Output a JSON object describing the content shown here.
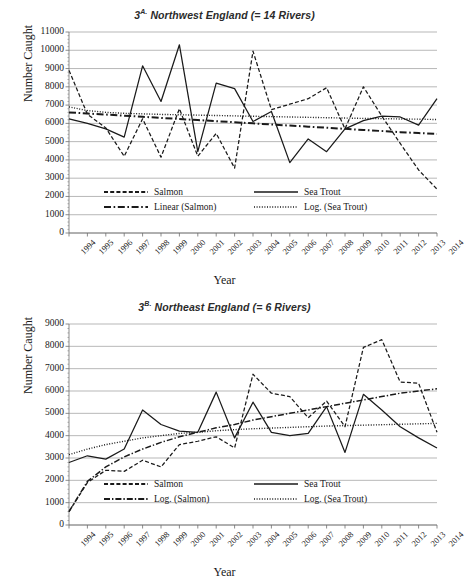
{
  "figure_a": {
    "title_prefix": "3",
    "title_sup": "A.",
    "title_main": "Northwest England (= 14 Rivers)",
    "title_full": "3A. Northwest England (= 14 Rivers)",
    "ylabel": "Number Caught",
    "xlabel": "Year",
    "legend": [
      {
        "label": "Salmon",
        "style": "dashed"
      },
      {
        "label": "Sea Trout",
        "style": "solid"
      },
      {
        "label": "Linear (Salmon)",
        "style": "longdash-dot"
      },
      {
        "label": "Log. (Sea Trout)",
        "style": "dotted"
      }
    ]
  },
  "figure_b": {
    "title_prefix": "3",
    "title_sup": "B.",
    "title_main": "Northeast England (= 6 Rivers)",
    "title_full": "3B. Northeast England (= 6 Rivers)",
    "ylabel": "Number Caught",
    "xlabel": "Year",
    "legend": [
      {
        "label": "Salmon",
        "style": "dashed"
      },
      {
        "label": "Sea Trout",
        "style": "solid"
      },
      {
        "label": "Log. (Salmon)",
        "style": "dashdot"
      },
      {
        "label": "Log. (Sea Trout)",
        "style": "dotted"
      }
    ]
  },
  "chart_data": [
    {
      "type": "line",
      "title": "3A. Northwest England (= 14 Rivers)",
      "xlabel": "Year",
      "ylabel": "Number Caught",
      "ylim": [
        0,
        11000
      ],
      "ytick_step": 1000,
      "yticks": [
        0,
        1000,
        2000,
        3000,
        4000,
        5000,
        6000,
        7000,
        8000,
        9000,
        10000,
        11000
      ],
      "grid": true,
      "legend_position": "inside-bottom",
      "categories": [
        1994,
        1995,
        1996,
        1997,
        1998,
        1999,
        2000,
        2001,
        2002,
        2003,
        2004,
        2005,
        2006,
        2007,
        2008,
        2009,
        2010,
        2011,
        2012,
        2013,
        2014
      ],
      "series": [
        {
          "name": "Salmon",
          "style": "dashed",
          "values": [
            8900,
            6500,
            5750,
            4200,
            6250,
            4150,
            6800,
            4200,
            5450,
            3550,
            9950,
            6750,
            7050,
            7350,
            7950,
            5700,
            8000,
            6400,
            4900,
            3450,
            2400
          ]
        },
        {
          "name": "Sea Trout",
          "style": "solid",
          "values": [
            6250,
            6000,
            5700,
            5250,
            9150,
            7200,
            10300,
            4450,
            8200,
            7900,
            6100,
            6650,
            3850,
            5150,
            4450,
            5700,
            6150,
            6400,
            6350,
            5900,
            7350
          ]
        },
        {
          "name": "Linear (Salmon)",
          "style": "longdash-dot",
          "trend": "linear",
          "values": [
            6600,
            6540,
            6480,
            6420,
            6360,
            6300,
            6240,
            6180,
            6120,
            6060,
            6000,
            5940,
            5880,
            5820,
            5760,
            5700,
            5640,
            5580,
            5520,
            5470,
            5420
          ]
        },
        {
          "name": "Log. (Sea Trout)",
          "style": "dotted",
          "trend": "logarithmic",
          "values": [
            6900,
            6700,
            6600,
            6550,
            6520,
            6490,
            6470,
            6450,
            6430,
            6410,
            6390,
            6370,
            6350,
            6330,
            6310,
            6290,
            6270,
            6260,
            6240,
            6230,
            6210
          ]
        }
      ]
    },
    {
      "type": "line",
      "title": "3B. Northeast England (= 6 Rivers)",
      "xlabel": "Year",
      "ylabel": "Number Caught",
      "ylim": [
        0,
        9000
      ],
      "ytick_step": 1000,
      "yticks": [
        0,
        1000,
        2000,
        3000,
        4000,
        5000,
        6000,
        7000,
        8000,
        9000
      ],
      "grid": true,
      "legend_position": "inside-bottom",
      "categories": [
        1994,
        1995,
        1996,
        1997,
        1998,
        1999,
        2000,
        2001,
        2002,
        2003,
        2004,
        2005,
        2006,
        2007,
        2008,
        2009,
        2010,
        2011,
        2012,
        2013,
        2014
      ],
      "series": [
        {
          "name": "Salmon",
          "style": "dashed",
          "values": [
            600,
            1900,
            2450,
            2400,
            2900,
            2600,
            3600,
            3750,
            3950,
            3450,
            6750,
            5900,
            5750,
            4800,
            5550,
            4400,
            7950,
            8300,
            6400,
            6350,
            4150
          ]
        },
        {
          "name": "Sea Trout",
          "style": "solid",
          "values": [
            2800,
            3100,
            2950,
            3400,
            5150,
            4500,
            4200,
            4150,
            5950,
            3900,
            5500,
            4150,
            4000,
            4100,
            5300,
            3250,
            5850,
            5150,
            4400,
            3900,
            3450
          ]
        },
        {
          "name": "Log. (Salmon)",
          "style": "dashdot",
          "trend": "logarithmic",
          "values": [
            600,
            1950,
            2600,
            3050,
            3400,
            3700,
            3950,
            4150,
            4350,
            4500,
            4700,
            4850,
            5000,
            5150,
            5300,
            5450,
            5600,
            5750,
            5900,
            6000,
            6100
          ]
        },
        {
          "name": "Log. (Sea Trout)",
          "style": "dotted",
          "trend": "logarithmic",
          "values": [
            3150,
            3400,
            3600,
            3750,
            3900,
            4000,
            4100,
            4150,
            4220,
            4270,
            4310,
            4340,
            4370,
            4400,
            4430,
            4450,
            4470,
            4490,
            4510,
            4530,
            4550
          ]
        }
      ]
    }
  ],
  "colors": {
    "line": "#1a1a1a",
    "grid": "#9a9a9a",
    "axis": "#6e6e6e",
    "text": "#1a1a1a",
    "background": "#ffffff"
  }
}
